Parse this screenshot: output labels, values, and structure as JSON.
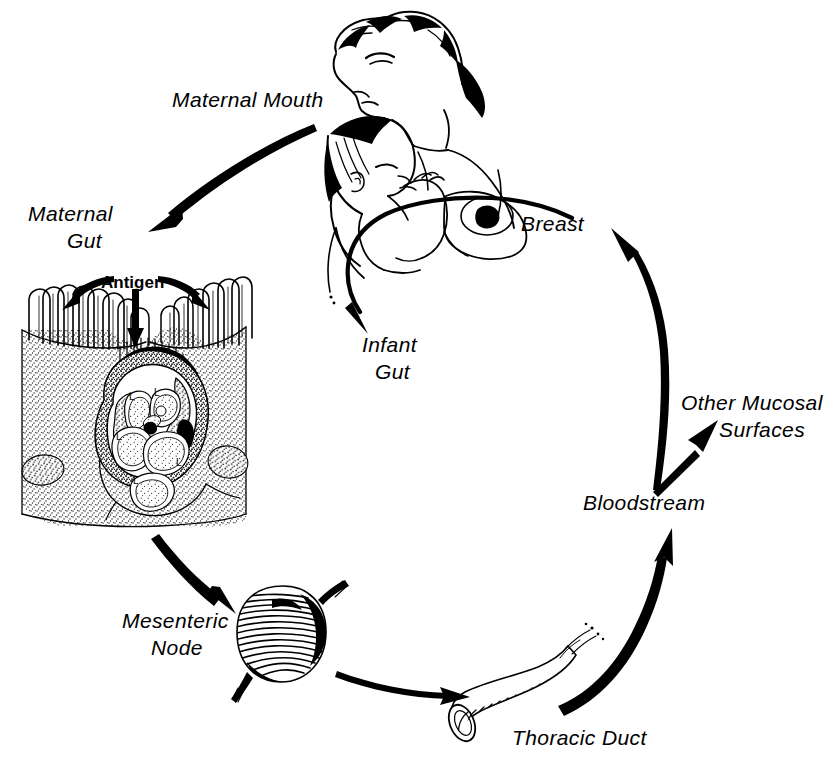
{
  "figure": {
    "background_color": "#ffffff",
    "ink_color": "#000000"
  },
  "labels": {
    "maternal_mouth": "Maternal Mouth",
    "maternal_gut_line1": "Maternal",
    "maternal_gut_line2": "Gut",
    "antigen": "Antigen",
    "mesenteric_line1": "Mesenteric",
    "mesenteric_line2": "Node",
    "thoracic_duct": "Thoracic Duct",
    "bloodstream": "Bloodstream",
    "other_mucosal_line1": "Other Mucosal",
    "other_mucosal_line2": "Surfaces",
    "breast": "Breast",
    "infant_gut_line1": "Infant",
    "infant_gut_line2": "Gut"
  },
  "cell_markers": {
    "m_cell": "M",
    "lymphocyte": "L"
  },
  "flow_steps": [
    "Maternal Mouth",
    "Maternal Gut",
    "Mesenteric Node",
    "Thoracic Duct",
    "Bloodstream",
    "Breast",
    "Infant Gut"
  ],
  "branches": [
    "Bloodstream to Breast",
    "Bloodstream to Other Mucosal Surfaces"
  ],
  "illustrations": {
    "mother_infant": "mother-nursing-infant",
    "gut_cross_section": "peyers-patch-cross-section",
    "lymph_node": "mesenteric-lymph-node",
    "duct": "thoracic-duct"
  }
}
